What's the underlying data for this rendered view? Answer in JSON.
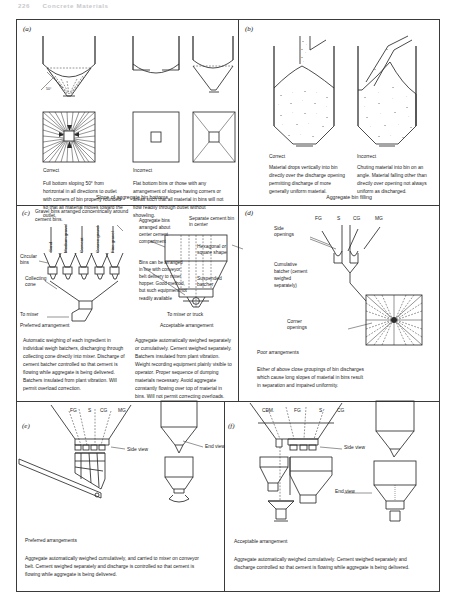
{
  "running_head": {
    "page_number": "226",
    "chapter": "Concrete Materials"
  },
  "panels": {
    "a": {
      "letter": "(a)",
      "correct_label": "Correct",
      "incorrect_label": "Incorrect",
      "angle_label": "50°",
      "correct_text": "Full bottom sloping 50° from horizontal in all directions to outlet with corners of bin properly rounded so that all material moves toward the outlet.",
      "incorrect_text": "Flat bottom bins or those with any arrangement of slopes having corners or areas such that all material in bins will not flow readily through outlet without shoveling."
    },
    "b": {
      "letter": "(b)",
      "correct_label": "Correct",
      "incorrect_label": "Incorrect",
      "correct_text": "Material drops vertically into bin directly over the discharge opening permitting discharge of more generally uniform material.",
      "incorrect_text": "Chuting material into bin on an angle. Material falling other than directly over opening not always uniform as discharged."
    },
    "c": {
      "letter": "(c)",
      "heading": "Gravel bins arranged concentrically around cement bins.",
      "bin_labels": [
        "Sand",
        "Medium gravel",
        "Cement",
        "Coarse gravel",
        "Fine gravel"
      ],
      "circular_bins_label": "Circular bins",
      "collecting_cone_label": "Collecting cone",
      "to_mixer_label": "To mixer",
      "preferred_label": "Preferred arrangement",
      "note_1": "Aggregate bins arranged about center cement compartment",
      "note_2": "Bins can be arranged in line with conveyor belt delivery to mixer hopper. Good method, but such equipment not readily available",
      "separate_cement_label": "Separate cement bin in center",
      "hexagonal_label": "Hexagonal or square shape",
      "suspended_batcher_label": "Suspended batcher",
      "to_mixer_truck_label": "To mixer or truck",
      "acceptable_label": "Acceptable arrangement",
      "preferred_text": "Automatic weighing of each ingredient in individual weigh batchers, discharging through collecting cone directly into mixer. Discharge of cement batcher controlled so that cement is flowing while aggregate is being delivered. Batchers insulated from plant vibration. Will permit overload correction.",
      "acceptable_text": "Aggregate automatically weighed separately or cumulatively. Cement weighed separately. Batchers insulated from plant vibration. Weight recording equipment plainly visible to operator. Proper sequence of dumping materials necessary. Avoid aggregate constantly flowing over top of material in bins. Will not permit correcting overloads."
    },
    "d": {
      "letter": "(d)",
      "bin_labels": [
        "FG",
        "S",
        "CG",
        "MG"
      ],
      "side_openings_label": "Side openings",
      "cumulative_label": "Cumulative batcher (cement weighed separately)",
      "corner_openings_label": "Corner openings",
      "poor_label": "Poor arrangements",
      "poor_text": "Either of above close groupings of bin discharges which cause long slopes of material in bins result in separation and impaired uniformity."
    },
    "e": {
      "letter": "(e)",
      "bin_labels": [
        "FG",
        "S",
        "CG",
        "MG"
      ],
      "side_view_label": "Side view",
      "end_view_label": "End view",
      "preferred_label": "Preferred arrangements",
      "text": "Aggregate automatically weighed cumulatively, and carried to mixer on conveyor belt. Cement weighed separately and discharge is controlled so that cement is flowing while aggregate is being delivered."
    },
    "f": {
      "letter": "(f)",
      "bin_labels": [
        "CEM.",
        "FG",
        "S",
        "CG"
      ],
      "side_view_label": "Side view",
      "end_view_label": "End view",
      "acceptable_label": "Acceptable arrangement",
      "text": "Aggregate automatically weighed cumulatively. Cement weighed separately and discharge controlled so that cement is flowing while aggregate is being delivered."
    }
  },
  "sections": {
    "slope": "Slope of aggregate bin bottoms",
    "filling": "Aggregate bin filling"
  }
}
